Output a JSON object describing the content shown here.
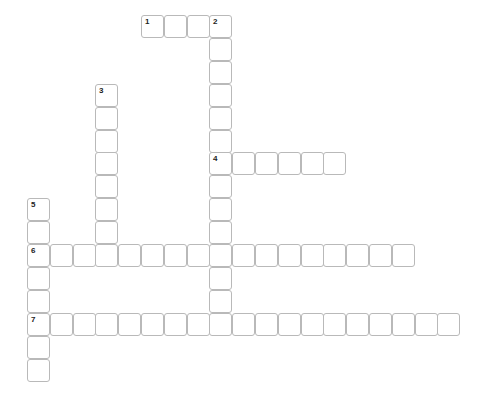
{
  "puzzle": {
    "type": "crossword",
    "grid": {
      "origin_x": 27,
      "origin_y": 15,
      "pitch_x": 22.8,
      "pitch_y": 22.9,
      "cell_size": 21,
      "border_color": "#b9b9b9",
      "background": "#ffffff"
    },
    "entries": [
      {
        "number": "1",
        "direction": "across",
        "row": 0,
        "col": 5,
        "length": 4
      },
      {
        "number": "2",
        "direction": "down",
        "row": 0,
        "col": 8,
        "length": 14
      },
      {
        "number": "3",
        "direction": "down",
        "row": 3,
        "col": 3,
        "length": 8
      },
      {
        "number": "4",
        "direction": "across",
        "row": 6,
        "col": 8,
        "length": 6
      },
      {
        "number": "5",
        "direction": "down",
        "row": 8,
        "col": 0,
        "length": 8
      },
      {
        "number": "6",
        "direction": "across",
        "row": 10,
        "col": 0,
        "length": 17
      },
      {
        "number": "7",
        "direction": "across",
        "row": 13,
        "col": 0,
        "length": 19
      }
    ]
  }
}
